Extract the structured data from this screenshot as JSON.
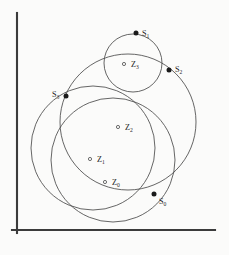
{
  "figure": {
    "title": "",
    "background_color": "#fbfbfa",
    "axis_color": "#3b3b3b",
    "curve_color": "#4a4a4a",
    "dot_color": "#1a1a1a",
    "label_color": "#1f1f1f"
  },
  "axes": {
    "y_axis": {
      "x": 17,
      "y_top": 13,
      "y_bottom": 233
    },
    "x_axis": {
      "y": 230,
      "x_left": 12,
      "x_right": 215
    }
  },
  "chart_data": {
    "type": "scatter",
    "title": "",
    "xlabel": "",
    "ylabel": "",
    "grid": false,
    "legend": null,
    "circles": [
      {
        "name": "Z0",
        "cx": 113,
        "cy": 160,
        "r": 62
      },
      {
        "name": "Z1",
        "cx": 93,
        "cy": 148,
        "r": 62
      },
      {
        "name": "Z2",
        "cx": 128,
        "cy": 122,
        "r": 68
      },
      {
        "name": "Z3",
        "cx": 133,
        "cy": 63,
        "r": 29
      }
    ],
    "centers": [
      {
        "label": "Z",
        "sub": "0",
        "x": 105,
        "y": 182,
        "label_x": 112,
        "label_y": 185
      },
      {
        "label": "Z",
        "sub": "1",
        "x": 90,
        "y": 159,
        "label_x": 97,
        "label_y": 162
      },
      {
        "label": "Z",
        "sub": "2",
        "x": 118,
        "y": 127,
        "label_x": 125,
        "label_y": 130
      },
      {
        "label": "Z",
        "sub": "3",
        "x": 124,
        "y": 64,
        "label_x": 131,
        "label_y": 67
      }
    ],
    "boundary_points": [
      {
        "label": "S",
        "sub": "0",
        "x": 154,
        "y": 194,
        "label_x": 159,
        "label_y": 204
      },
      {
        "label": "S",
        "sub": "1",
        "x": 136,
        "y": 33,
        "label_x": 142,
        "label_y": 36
      },
      {
        "label": "S",
        "sub": "2",
        "x": 169,
        "y": 70,
        "label_x": 175,
        "label_y": 72
      },
      {
        "label": "S",
        "sub": "3",
        "x": 66,
        "y": 96,
        "label_x": 52,
        "label_y": 97
      }
    ]
  }
}
